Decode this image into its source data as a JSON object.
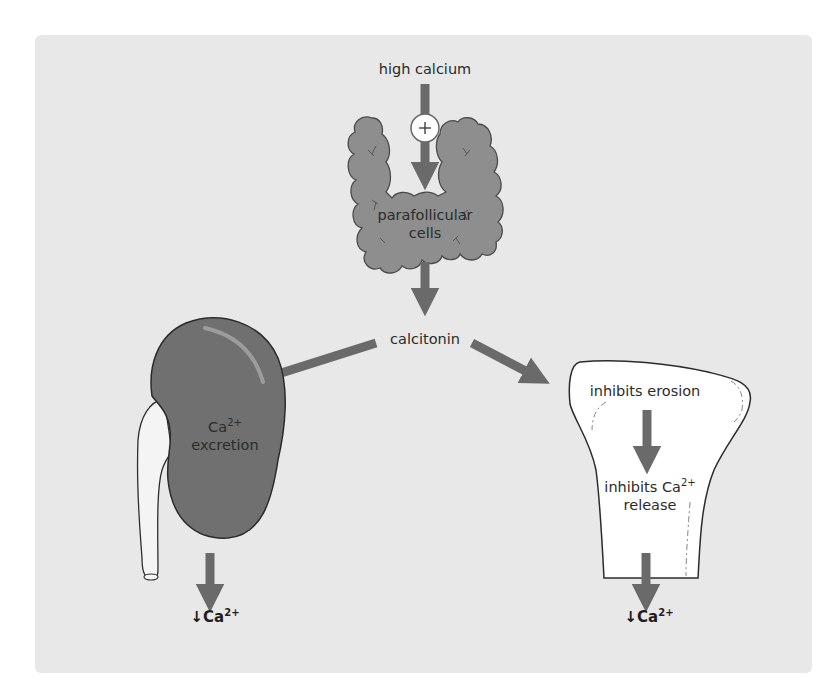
{
  "diagram": {
    "type": "flow",
    "colors": {
      "background": "#e8e8e8",
      "arrow": "#6a6a6a",
      "thyroid": "#8e8e8e",
      "kidney": "#707070",
      "bone": "#ffffff",
      "text": "#2b2b2b"
    },
    "nodes": {
      "stimulus": "high calcium",
      "stimulus_sign": "+",
      "gland_line1": "parafollicular",
      "gland_line2": "cells",
      "hormone": "calcitonin",
      "kidney_line1": "Ca",
      "kidney_sup": "2+",
      "kidney_line2": "excretion",
      "kidney_result": "↓Ca",
      "kidney_result_sup": "2+",
      "bone_step1": "inhibits erosion",
      "bone_step2_line1": "inhibits Ca",
      "bone_step2_sup": "2+",
      "bone_step2_line2": "release",
      "bone_result": "↓Ca",
      "bone_result_sup": "2+"
    },
    "edges": [
      {
        "from": "high calcium",
        "to": "parafollicular cells",
        "sign": "+"
      },
      {
        "from": "parafollicular cells",
        "to": "calcitonin"
      },
      {
        "from": "calcitonin",
        "to": "Ca2+ excretion"
      },
      {
        "from": "calcitonin",
        "to": "inhibits erosion"
      },
      {
        "from": "inhibits erosion",
        "to": "inhibits Ca2+ release"
      },
      {
        "from": "Ca2+ excretion",
        "to": "↓Ca2+"
      },
      {
        "from": "inhibits Ca2+ release",
        "to": "↓Ca2+"
      }
    ]
  }
}
